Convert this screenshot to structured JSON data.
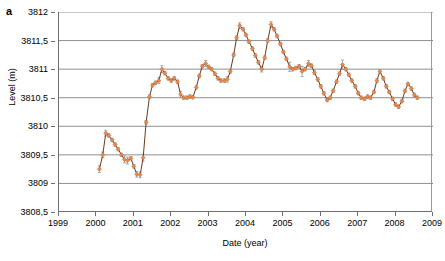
{
  "panel": {
    "label": "a"
  },
  "chart_data": {
    "type": "line",
    "title": "",
    "xlabel": "Date (year)",
    "ylabel": "Level (m)",
    "xlim": [
      1999,
      2009
    ],
    "ylim": [
      3808.5,
      3812
    ],
    "xticks": [
      1999,
      2000,
      2001,
      2002,
      2003,
      2004,
      2005,
      2006,
      2007,
      2008,
      2009
    ],
    "xticklabels": [
      "1999",
      "2000",
      "2001",
      "2002",
      "2003",
      "2004",
      "2005",
      "2006",
      "2007",
      "2008",
      "2009"
    ],
    "yticks": [
      3808.5,
      3809,
      3809.5,
      3810,
      3810.5,
      3811,
      3811.5,
      3812
    ],
    "yticklabels": [
      "3808,5",
      "3809",
      "3809,5",
      "3810",
      "3810,5",
      "3811",
      "3811,5",
      "3812"
    ],
    "grid": "horizontal",
    "legend": "none",
    "decimal_separator": ",",
    "marker": "diamond",
    "marker_color": "#E8894A",
    "line_color": "#6B3A1E",
    "errorbar_color": "#8D9BB0",
    "errorbar": true,
    "series": [
      {
        "name": "Level",
        "x": [
          2000.08,
          2000.17,
          2000.25,
          2000.33,
          2000.42,
          2000.5,
          2000.58,
          2000.67,
          2000.75,
          2000.83,
          2000.92,
          2001.0,
          2001.08,
          2001.17,
          2001.25,
          2001.33,
          2001.42,
          2001.5,
          2001.58,
          2001.67,
          2001.75,
          2001.83,
          2001.92,
          2002.0,
          2002.08,
          2002.17,
          2002.25,
          2002.33,
          2002.42,
          2002.5,
          2002.58,
          2002.67,
          2002.75,
          2002.83,
          2002.92,
          2003.0,
          2003.08,
          2003.17,
          2003.25,
          2003.33,
          2003.42,
          2003.5,
          2003.58,
          2003.67,
          2003.75,
          2003.83,
          2003.92,
          2004.0,
          2004.08,
          2004.17,
          2004.25,
          2004.33,
          2004.42,
          2004.5,
          2004.58,
          2004.67,
          2004.75,
          2004.83,
          2004.92,
          2005.0,
          2005.08,
          2005.17,
          2005.25,
          2005.33,
          2005.42,
          2005.5,
          2005.58,
          2005.67,
          2005.75,
          2005.83,
          2005.92,
          2006.0,
          2006.08,
          2006.17,
          2006.25,
          2006.33,
          2006.42,
          2006.5,
          2006.58,
          2006.67,
          2006.75,
          2006.83,
          2006.92,
          2007.0,
          2007.08,
          2007.17,
          2007.25,
          2007.33,
          2007.42,
          2007.5,
          2007.58,
          2007.67,
          2007.75,
          2007.83,
          2007.92,
          2008.0,
          2008.08,
          2008.17,
          2008.25,
          2008.33,
          2008.42,
          2008.5,
          2008.58
        ],
        "y": [
          3809.25,
          3809.5,
          3809.88,
          3809.84,
          3809.76,
          3809.68,
          3809.6,
          3809.5,
          3809.42,
          3809.4,
          3809.44,
          3809.3,
          3809.16,
          3809.15,
          3809.45,
          3810.07,
          3810.52,
          3810.72,
          3810.76,
          3810.8,
          3811.0,
          3810.93,
          3810.84,
          3810.8,
          3810.84,
          3810.78,
          3810.56,
          3810.5,
          3810.5,
          3810.52,
          3810.51,
          3810.68,
          3810.88,
          3811.05,
          3811.1,
          3811.04,
          3811.0,
          3810.92,
          3810.84,
          3810.8,
          3810.8,
          3810.82,
          3810.96,
          3811.25,
          3811.55,
          3811.76,
          3811.7,
          3811.6,
          3811.48,
          3811.36,
          3811.24,
          3811.12,
          3811.0,
          3811.2,
          3811.5,
          3811.78,
          3811.7,
          3811.58,
          3811.44,
          3811.3,
          3811.18,
          3811.04,
          3811.0,
          3811.02,
          3811.05,
          3810.96,
          3811.0,
          3811.1,
          3811.06,
          3810.94,
          3810.82,
          3810.7,
          3810.58,
          3810.46,
          3810.5,
          3810.62,
          3810.78,
          3810.92,
          3811.08,
          3811.0,
          3810.9,
          3810.8,
          3810.7,
          3810.58,
          3810.5,
          3810.48,
          3810.52,
          3810.5,
          3810.6,
          3810.8,
          3810.96,
          3810.84,
          3810.7,
          3810.6,
          3810.48,
          3810.38,
          3810.34,
          3810.44,
          3810.62,
          3810.74,
          3810.66,
          3810.55,
          3810.5
        ],
        "yerr": [
          0.06,
          0.05,
          0.05,
          0.03,
          0.03,
          0.03,
          0.03,
          0.03,
          0.06,
          0.06,
          0.03,
          0.03,
          0.05,
          0.05,
          0.06,
          0.03,
          0.03,
          0.03,
          0.03,
          0.05,
          0.06,
          0.03,
          0.03,
          0.03,
          0.03,
          0.03,
          0.05,
          0.03,
          0.03,
          0.03,
          0.03,
          0.03,
          0.03,
          0.03,
          0.05,
          0.03,
          0.03,
          0.03,
          0.03,
          0.03,
          0.03,
          0.05,
          0.03,
          0.03,
          0.03,
          0.05,
          0.03,
          0.03,
          0.03,
          0.03,
          0.03,
          0.03,
          0.05,
          0.03,
          0.03,
          0.05,
          0.03,
          0.03,
          0.03,
          0.03,
          0.03,
          0.08,
          0.03,
          0.03,
          0.03,
          0.09,
          0.03,
          0.05,
          0.03,
          0.03,
          0.03,
          0.03,
          0.03,
          0.03,
          0.03,
          0.03,
          0.03,
          0.03,
          0.08,
          0.03,
          0.03,
          0.03,
          0.03,
          0.03,
          0.03,
          0.03,
          0.03,
          0.03,
          0.03,
          0.03,
          0.03,
          0.03,
          0.03,
          0.03,
          0.03,
          0.03,
          0.03,
          0.03,
          0.03,
          0.03,
          0.03,
          0.03,
          0.03
        ]
      }
    ]
  }
}
